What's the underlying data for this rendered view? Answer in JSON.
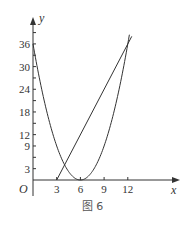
{
  "chart_data": {
    "type": "line",
    "title": "",
    "caption": "图 6",
    "xlabel": "x",
    "ylabel": "y",
    "origin_label": "O",
    "x_ticks": [
      3,
      6,
      9,
      12
    ],
    "y_ticks": [
      3,
      9,
      12,
      18,
      24,
      30,
      36
    ],
    "xlim": [
      0,
      14
    ],
    "ylim": [
      0,
      40
    ],
    "grid": false,
    "legend": null,
    "series": [
      {
        "name": "parabola y=(x-6)^2",
        "type": "curve",
        "points": [
          [
            0,
            36
          ],
          [
            1,
            25
          ],
          [
            2,
            16
          ],
          [
            3,
            9
          ],
          [
            4,
            4
          ],
          [
            5,
            1
          ],
          [
            6,
            0
          ],
          [
            7,
            1
          ],
          [
            8,
            4
          ],
          [
            9,
            9
          ],
          [
            10,
            16
          ],
          [
            11,
            25
          ],
          [
            12,
            36
          ],
          [
            12.2,
            38.4
          ]
        ]
      },
      {
        "name": "line y=4(x-3)",
        "type": "line",
        "points": [
          [
            3,
            0
          ],
          [
            12.5,
            38
          ]
        ]
      }
    ],
    "annotations": []
  },
  "labels": {
    "x_axis": "x",
    "y_axis": "y",
    "origin": "O",
    "caption": "图 6",
    "x_ticks": [
      "3",
      "6",
      "9",
      "12"
    ],
    "y_ticks": [
      "3",
      "9",
      "12",
      "18",
      "24",
      "30",
      "36"
    ]
  }
}
